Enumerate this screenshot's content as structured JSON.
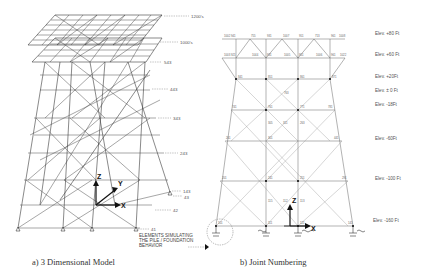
{
  "figure": {
    "panel_a": {
      "caption": "a)  3 Dimensional Model",
      "level_labels": [
        {
          "text": "1200's",
          "x": 191,
          "y": 18
        },
        {
          "text": "1000's",
          "x": 180,
          "y": 44
        },
        {
          "text": "543",
          "x": 164,
          "y": 64
        },
        {
          "text": "443",
          "x": 170,
          "y": 91
        },
        {
          "text": "343",
          "x": 173,
          "y": 120
        },
        {
          "text": "243",
          "x": 180,
          "y": 155
        },
        {
          "text": "143",
          "x": 183,
          "y": 193
        },
        {
          "text": "43",
          "x": 184,
          "y": 198
        },
        {
          "text": "42",
          "x": 173,
          "y": 212
        },
        {
          "text": "41",
          "x": 151,
          "y": 231
        }
      ],
      "axes": {
        "z": "Z",
        "y": "Y",
        "x": "X"
      },
      "callout": [
        "ELEMENTS SIMULATING",
        "THE PILE / FOUNDATION",
        "BEHAVIOR"
      ]
    },
    "panel_b": {
      "caption": "b)  Joint Numbering",
      "elevations": [
        {
          "text": "Elev. +80 Ft",
          "y": 35
        },
        {
          "text": "Elev. +60 Ft",
          "y": 56
        },
        {
          "text": "Elev. +20Ft",
          "y": 78
        },
        {
          "text": "Elev. ± 0 Ft",
          "y": 92
        },
        {
          "text": "Elev. -18Ft",
          "y": 106
        },
        {
          "text": "Elev. -60Ft",
          "y": 140
        },
        {
          "text": "Elev. -100 Ft",
          "y": 180
        },
        {
          "text": "Elev. -160 Ft",
          "y": 222
        }
      ],
      "joints_top": [
        "1002",
        "941",
        "755",
        "931",
        "1007",
        "951",
        "713",
        "961",
        "1008"
      ],
      "joints_second": [
        "1003",
        "921",
        "1044",
        "931",
        "1005",
        "951",
        "1006",
        "961",
        "1022"
      ],
      "joints_mid": [
        "841",
        "851",
        "861",
        "871",
        "763",
        "741",
        "761",
        "771",
        "781",
        "305",
        "311",
        "263",
        "261",
        "301",
        "441"
      ],
      "joints_lower": [
        "201",
        "241",
        "251",
        "291",
        "115",
        "112",
        "113"
      ],
      "joints_bottom": [
        "101",
        "111",
        "121",
        "141"
      ],
      "axes": {
        "z": "Z",
        "x": "X"
      }
    }
  }
}
